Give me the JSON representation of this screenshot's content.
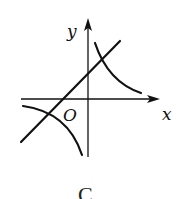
{
  "figure": {
    "caption": "C",
    "axes": {
      "x_label": "x",
      "y_label": "y",
      "origin_label": "O"
    },
    "curves": [
      {
        "name": "line",
        "description": "straight line with positive slope and positive y-intercept"
      },
      {
        "name": "hyperbola",
        "description": "inverse-proportion curve with branches in quadrants I and III"
      }
    ]
  },
  "colors": {
    "stroke": "#111111",
    "background": "#ffffff"
  }
}
